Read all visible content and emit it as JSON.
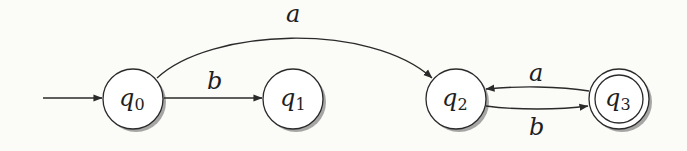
{
  "diagram": {
    "type": "finite-automaton",
    "colors": {
      "background": "#fbfbf8",
      "stroke": "#2a2a2a",
      "node_fill": "#ffffff",
      "shadow": "#8a8a8a"
    },
    "start_state": "q0",
    "nodes": [
      {
        "id": "q0",
        "base": "q",
        "sub": "0",
        "cx": 133,
        "cy": 99,
        "r": 30,
        "accepting": false
      },
      {
        "id": "q1",
        "base": "q",
        "sub": "1",
        "cx": 293,
        "cy": 99,
        "r": 30,
        "accepting": false
      },
      {
        "id": "q2",
        "base": "q",
        "sub": "2",
        "cx": 456,
        "cy": 99,
        "r": 30,
        "accepting": false
      },
      {
        "id": "q3",
        "base": "q",
        "sub": "3",
        "cx": 619,
        "cy": 99,
        "r": 30,
        "accepting": true
      }
    ],
    "edges": [
      {
        "from": "q0",
        "to": "q2",
        "label": "a"
      },
      {
        "from": "q0",
        "to": "q1",
        "label": "b"
      },
      {
        "from": "q3",
        "to": "q2",
        "label": "a"
      },
      {
        "from": "q2",
        "to": "q3",
        "label": "b"
      }
    ]
  }
}
